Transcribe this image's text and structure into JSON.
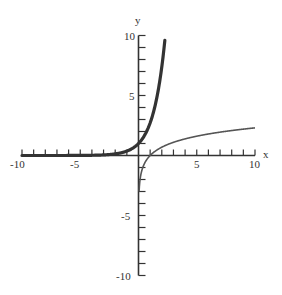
{
  "chart_data": {
    "type": "line",
    "title": "",
    "xlabel": "x",
    "ylabel": "y",
    "xlim": [
      -10,
      10
    ],
    "ylim": [
      -10,
      10
    ],
    "grid": false,
    "legend": null,
    "x_ticks": {
      "labels": [
        "-10",
        "-5",
        "5",
        "10"
      ],
      "values": [
        -10,
        -5,
        5,
        10
      ],
      "minor_step": 1
    },
    "y_ticks": {
      "labels": [
        "-10",
        "-5",
        "5",
        "10"
      ],
      "values": [
        -10,
        -5,
        5,
        10
      ],
      "minor_step": 1
    },
    "series": [
      {
        "name": "y = e^x",
        "style": "thick",
        "color": "#333333",
        "x": [
          -10,
          -8,
          -6,
          -4,
          -3,
          -2,
          -1,
          0,
          0.5,
          1,
          1.5,
          2,
          2.3
        ],
        "y": [
          0.0,
          0.0003,
          0.0025,
          0.018,
          0.05,
          0.135,
          0.368,
          1.0,
          1.649,
          2.718,
          4.482,
          7.389,
          9.974
        ]
      },
      {
        "name": "y = ln x",
        "style": "thin",
        "color": "#555555",
        "x": [
          0.05,
          0.1,
          0.2,
          0.5,
          1,
          2,
          3,
          4,
          5,
          6,
          7,
          8,
          9,
          10
        ],
        "y": [
          -3.0,
          -2.303,
          -1.609,
          -0.693,
          0,
          0.693,
          1.099,
          1.386,
          1.609,
          1.792,
          1.946,
          2.079,
          2.197,
          2.303
        ]
      }
    ]
  },
  "axes": {
    "x_label": "x",
    "y_label": "y",
    "x_tick_labels": [
      "-10",
      "-5",
      "5",
      "10"
    ],
    "y_tick_labels": [
      "10",
      "5",
      "-5",
      "-10"
    ]
  }
}
